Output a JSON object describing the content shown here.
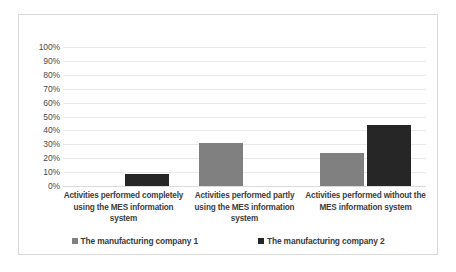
{
  "chart_data": {
    "type": "bar",
    "title": "",
    "xlabel": "",
    "ylabel": "",
    "ylim": [
      0,
      100
    ],
    "grid": true,
    "legend_position": "bottom",
    "categories": [
      "Activities performed completely using the MES information system",
      "Activities performed partly using the MES information system",
      "Activities performed without the MES information system"
    ],
    "ytick_labels": [
      "100%",
      "90%",
      "80%",
      "70%",
      "60%",
      "50%",
      "40%",
      "30%",
      "20%",
      "10%",
      "0%"
    ],
    "ytick_values": [
      100,
      90,
      80,
      70,
      60,
      50,
      40,
      30,
      20,
      10,
      0
    ],
    "series": [
      {
        "name": "The manufacturing company 1",
        "color": "#808080",
        "values": [
          0,
          31,
          24
        ]
      },
      {
        "name": "The manufacturing company 2",
        "color": "#262626",
        "values": [
          9,
          0,
          44
        ]
      }
    ]
  },
  "colors": {
    "series_1": "#808080",
    "series_2": "#262626",
    "gridline": "#e8e8e8",
    "border": "#d9d9d9",
    "text": "#3d3d3d",
    "axis_text": "#4a4a4a",
    "background": "#ffffff"
  }
}
